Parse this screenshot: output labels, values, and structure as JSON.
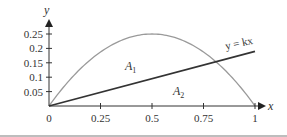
{
  "chart_data": {
    "type": "line",
    "title": "",
    "xlabel": "x",
    "ylabel": "y",
    "xlim": [
      0,
      1
    ],
    "ylim": [
      0,
      0.25
    ],
    "grid": false,
    "x_ticks": [
      "0",
      "0.25",
      "0.5",
      "0.75",
      "1"
    ],
    "y_ticks": [
      "0.05",
      "0.1",
      "0.15",
      "0.2",
      "0.25"
    ],
    "series": [
      {
        "name": "y = x(1 - x)",
        "kind": "curve",
        "color": "#9a9a9a",
        "x": [
          0,
          0.1,
          0.2,
          0.3,
          0.4,
          0.5,
          0.6,
          0.7,
          0.8,
          0.9,
          1.0
        ],
        "values": [
          0,
          0.09,
          0.16,
          0.21,
          0.24,
          0.25,
          0.24,
          0.21,
          0.16,
          0.09,
          0
        ]
      },
      {
        "name": "y = kx",
        "kind": "line",
        "color": "#333333",
        "k": 0.19,
        "x": [
          0,
          1
        ],
        "values": [
          0,
          0.19
        ]
      }
    ],
    "annotations": [
      {
        "text": "y = kx",
        "x": 0.95,
        "y": 0.215
      },
      {
        "text": "A",
        "sub": "1",
        "x": 0.39,
        "y": 0.135
      },
      {
        "text": "A",
        "sub": "2",
        "x": 0.62,
        "y": 0.05
      }
    ]
  },
  "labels": {
    "x_axis": "x",
    "y_axis": "y",
    "line_eq": "y = kx",
    "a1": "A",
    "a1_sub": "1",
    "a2": "A",
    "a2_sub": "2"
  }
}
